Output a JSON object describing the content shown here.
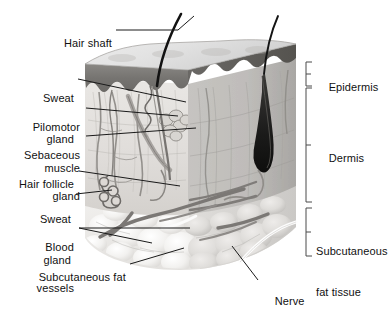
{
  "figure": {
    "type": "anatomical-diagram",
    "colors": {
      "background": "#ffffff",
      "text": "#111111",
      "leader_line": "#1a1a1a",
      "bracket": "#4a4a4a",
      "epidermis_band": "#6f6f6f",
      "epidermis_top": "#d9d9d9",
      "dermis_front": "#e2e2e2",
      "dermis_side": "#bcbcbc",
      "subcutaneous_fat": "#efefef",
      "hair": "#141414",
      "vessel": "#7a7a7a",
      "nerve": "#fdfdfd"
    }
  },
  "labels_left": [
    {
      "id": "hair-shaft",
      "text": "Hair shaft",
      "lines": [
        "Hair shaft"
      ]
    },
    {
      "id": "sweat-gland-upper",
      "text": "Sweat gland",
      "lines": [
        "Sweat",
        "gland"
      ]
    },
    {
      "id": "pilomotor-muscle",
      "text": "Pilomotor muscle",
      "lines": [
        "Pilomotor",
        "muscle"
      ]
    },
    {
      "id": "sebaceous-gland",
      "text": "Sebaceous gland",
      "lines": [
        "Sebaceous",
        "gland"
      ]
    },
    {
      "id": "hair-follicle",
      "text": "Hair follicle",
      "lines": [
        "Hair follicle"
      ]
    },
    {
      "id": "sweat-gland-lower",
      "text": "Sweat gland",
      "lines": [
        "Sweat",
        "gland"
      ]
    },
    {
      "id": "blood-vessels",
      "text": "Blood vessels",
      "lines": [
        "Blood",
        "vessels"
      ]
    },
    {
      "id": "subcutaneous-fat",
      "text": "Subcutaneous fat",
      "lines": [
        "Subcutaneous fat"
      ]
    }
  ],
  "labels_right": [
    {
      "id": "epidermis",
      "text": "Epidermis",
      "lines": [
        "Epidermis"
      ]
    },
    {
      "id": "dermis",
      "text": "Dermis",
      "lines": [
        "Dermis"
      ]
    },
    {
      "id": "subcutaneous-fat-tissue",
      "text": "Subcutaneous fat tissue",
      "lines": [
        "Subcutaneous",
        "fat tissue"
      ]
    },
    {
      "id": "nerve",
      "text": "Nerve",
      "lines": [
        "Nerve"
      ]
    }
  ],
  "text": {
    "hair_shaft": "Hair shaft",
    "sweat_l1": "Sweat",
    "sweat_l2": "gland",
    "pilomotor_l1": "Pilomotor",
    "pilomotor_l2": "muscle",
    "sebaceous_l1": "Sebaceous",
    "sebaceous_l2": "gland",
    "hair_follicle": "Hair follicle",
    "sweat2_l1": "Sweat",
    "sweat2_l2": "gland",
    "blood_l1": "Blood",
    "blood_l2": "vessels",
    "subcutaneous_fat": "Subcutaneous fat",
    "epidermis": "Epidermis",
    "dermis": "Dermis",
    "subq_l1": "Subcutaneous",
    "subq_l2": "fat tissue",
    "nerve": "Nerve"
  },
  "brackets": [
    {
      "id": "epidermis-bracket",
      "top": 62,
      "bottom": 86,
      "x": 306
    },
    {
      "id": "dermis-bracket",
      "top": 88,
      "bottom": 202,
      "x": 306
    },
    {
      "id": "subcutaneous-bracket",
      "top": 208,
      "bottom": 256,
      "x": 306
    }
  ]
}
